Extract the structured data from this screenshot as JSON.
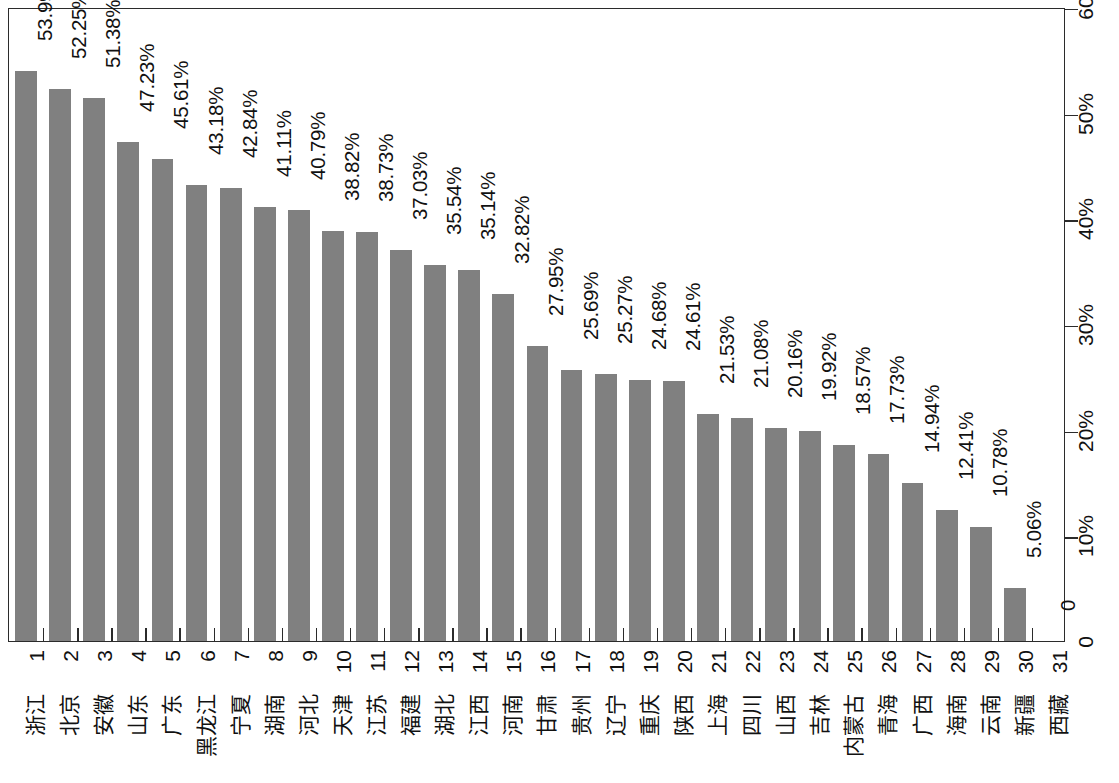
{
  "chart_data": {
    "type": "bar",
    "title": "",
    "subtitle": "",
    "xlabel": "",
    "ylabel": "",
    "orientation": "vertical-on-rotated-page",
    "grid": false,
    "legend": null,
    "ylim": [
      0,
      60
    ],
    "y_tick_labels": [
      "0",
      "10%",
      "20%",
      "30%",
      "40%",
      "50%",
      "60"
    ],
    "y_tick_values": [
      0,
      10,
      20,
      30,
      40,
      50,
      60
    ],
    "x_index_labels": [
      "1",
      "2",
      "3",
      "4",
      "5",
      "6",
      "7",
      "8",
      "9",
      "10",
      "11",
      "12",
      "13",
      "14",
      "15",
      "16",
      "17",
      "18",
      "19",
      "20",
      "21",
      "22",
      "23",
      "24",
      "25",
      "26",
      "27",
      "28",
      "29",
      "30",
      "31"
    ],
    "categories": [
      "浙江",
      "北京",
      "安徽",
      "山东",
      "广东",
      "黑龙江",
      "宁夏",
      "湖南",
      "河北",
      "天津",
      "江苏",
      "福建",
      "湖北",
      "江西",
      "河南",
      "甘肃",
      "贵州",
      "辽宁",
      "重庆",
      "陕西",
      "上海",
      "四川",
      "山西",
      "吉林",
      "内蒙古",
      "青海",
      "广西",
      "海南",
      "云南",
      "新疆",
      "西藏"
    ],
    "values": [
      53.99,
      52.25,
      51.38,
      47.23,
      45.61,
      43.18,
      42.84,
      41.11,
      40.79,
      38.82,
      38.73,
      37.03,
      35.54,
      35.14,
      32.82,
      27.95,
      25.69,
      25.27,
      24.68,
      24.61,
      21.53,
      21.08,
      20.16,
      19.92,
      18.57,
      17.73,
      14.94,
      12.41,
      10.78,
      5.06,
      0
    ],
    "data_labels": [
      "53.99%",
      "52.25%",
      "51.38%",
      "47.23%",
      "45.61%",
      "43.18%",
      "42.84%",
      "41.11%",
      "40.79%",
      "38.82%",
      "38.73%",
      "37.03%",
      "35.54%",
      "35.14%",
      "32.82%",
      "27.95%",
      "25.69%",
      "25.27%",
      "24.68%",
      "24.61%",
      "21.53%",
      "21.08%",
      "20.16%",
      "19.92%",
      "18.57%",
      "17.73%",
      "14.94%",
      "12.41%",
      "10.78%",
      "5.06%",
      "0"
    ],
    "series": [
      {
        "name": "",
        "color": "#808080",
        "values": [
          53.99,
          52.25,
          51.38,
          47.23,
          45.61,
          43.18,
          42.84,
          41.11,
          40.79,
          38.82,
          38.73,
          37.03,
          35.54,
          35.14,
          32.82,
          27.95,
          25.69,
          25.27,
          24.68,
          24.61,
          21.53,
          21.08,
          20.16,
          19.92,
          18.57,
          17.73,
          14.94,
          12.41,
          10.78,
          5.06,
          0
        ]
      }
    ]
  },
  "style": {
    "bar_color": "#808080",
    "axis_color": "#2b2b2b",
    "text_color": "#111111",
    "background": "#ffffff"
  }
}
